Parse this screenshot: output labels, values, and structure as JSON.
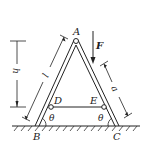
{
  "diagram": {
    "points": {
      "A": "A",
      "B": "B",
      "C": "C",
      "D": "D",
      "E": "E"
    },
    "force": {
      "label": "F",
      "direction": "down"
    },
    "dimensions": {
      "height": "h",
      "leg_length": "l",
      "load_distance": "a"
    },
    "angles": {
      "left": "θ",
      "right": "θ"
    },
    "colors": {
      "line": "#222222",
      "background": "#ffffff"
    }
  }
}
